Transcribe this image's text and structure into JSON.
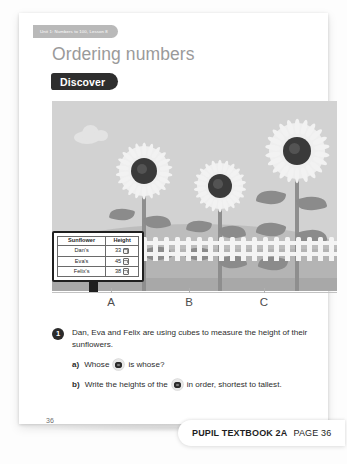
{
  "unit_tag": "Unit 1: Numbers to 100, Lesson 8",
  "title": "Ordering numbers",
  "section_badge": "Discover",
  "illustration": {
    "plant_labels": [
      "A",
      "B",
      "C"
    ],
    "alt": "three-sunflowers-garden-scene"
  },
  "table": {
    "headers": [
      "Sunflower",
      "Height"
    ],
    "rows": [
      {
        "name": "Dan's",
        "height": "33"
      },
      {
        "name": "Eva's",
        "height": "45"
      },
      {
        "name": "Felix's",
        "height": "38"
      }
    ]
  },
  "questions": {
    "number": "1",
    "stem": "Dan, Eva and Felix are using cubes to measure the height of their sunflowers.",
    "parts": [
      {
        "label": "a)",
        "before_icon": "Whose",
        "after_icon": "is whose?"
      },
      {
        "label": "b)",
        "before_icon": "Write the heights of the",
        "after_icon": "in order, shortest to tallest."
      }
    ]
  },
  "page_number": "36",
  "footer": {
    "book": "PUPIL TEXTBOOK 2A",
    "page": "PAGE 36"
  },
  "colors": {
    "badge_bg": "#2e2e2e",
    "title": "#9a9a9a",
    "tag_bg": "#b9b9b9",
    "sky": "#d2d2d2",
    "ground": "#b4b4b4",
    "fence": "#f4f4f4",
    "flower_center": "#3a3a3a"
  }
}
